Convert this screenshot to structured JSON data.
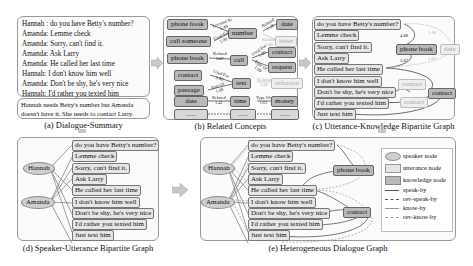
{
  "panel_a": {
    "dialogue": [
      {
        "speaker": "Hannah :",
        "text": "do you have Betty's number?"
      },
      {
        "speaker": "Amanda:",
        "text": "Lemme check"
      },
      {
        "speaker": "Amanda:",
        "text": "Sorry, can't find it."
      },
      {
        "speaker": "Amanda:",
        "text": "Ask Larry"
      },
      {
        "speaker": "Amanda:",
        "text": "He called her last time"
      },
      {
        "speaker": "Hannah:",
        "text": "I don't know him well"
      },
      {
        "speaker": "Amanda:",
        "text": "Don't be shy, he's very nice"
      },
      {
        "speaker": "Hannah:",
        "text": "I'd rather you texted him"
      },
      {
        "speaker": "Amanda:",
        "text": "Just text him"
      }
    ],
    "summary": "Hannah needs Betty's number but Amanda doesn't have it. She needs to contact Larry.",
    "caption": "(a) Dialogue-Summary"
  },
  "panel_b": {
    "caption": "(b) Related Concepts",
    "nodes": {
      "phone_book_1": "phone book",
      "call_someone": "call someone",
      "number": "number",
      "date_1": "date",
      "letter": "letter",
      "phone_book_2": "phone book",
      "call": "call",
      "contact_1": "contact",
      "request": "request",
      "contact_2": "contact",
      "passage": "passage",
      "text": "text",
      "refractor": "refractor",
      "date_2": "date",
      "time": "time",
      "money": "money",
      "dots": "......"
    },
    "relations": {
      "r1": "Located At\n5.49",
      "r2": "Used For\n1.00",
      "r3": "Related\n1.18",
      "r4": "Related\n1.00",
      "r5": "Related\n5.07",
      "r6": "Used For\n1.00",
      "r7": "Type Of\n1.00",
      "r8": "Used For\n1.00",
      "r9": "Part Of\n1.00",
      "r10": "Related\n1.00",
      "r11": "Related\n1.41",
      "r12": "Type Of\n1.61"
    }
  },
  "panel_c": {
    "caption": "(c) Utterance-Knowledge Bipartite Graph",
    "utterances": [
      "do you have Betty's number?",
      "Lemme check",
      "Sorry, can't find it.",
      "Ask Larry",
      "He called her last time",
      "I don't know him well",
      "Don't be shy, he's very nice",
      "I'd rather you texted him",
      "Just text him"
    ],
    "knowledge": {
      "phone_book": "phone book",
      "date": "date",
      "contact": "contact",
      "contact_faint_1": "contact",
      "contact_faint_2": "contact"
    },
    "weights": {
      "w1": "4.88",
      "w2": "1.18",
      "w3": "5.07",
      "w4": "5.07"
    }
  },
  "panel_d": {
    "caption": "(d) Speaker-Utterance Bipartite Graph",
    "speakers": [
      "Hannah",
      "Amanda"
    ],
    "utterances": [
      "do you have Betty's number?",
      "Lemme check",
      "Sorry, can't find it.",
      "Ask Larry",
      "He called her last time",
      "I don't know him well",
      "Don't be shy, he's very nice",
      "I'd rather you texted him",
      "Just text him"
    ]
  },
  "panel_e": {
    "caption": "(e) Heterogeneous Dialogue Graph",
    "speakers": [
      "Hannah",
      "Amanda"
    ],
    "utterances": [
      "do you have Betty's number?",
      "Lemme check",
      "Sorry, can't find it.",
      "Ask Larry",
      "He called her last time",
      "I don't know him well",
      "Don't be shy, he's very nice",
      "I'd rather you texted him",
      "Just text him"
    ],
    "knowledge": [
      "phone book",
      "contact"
    ],
    "legend": [
      {
        "label": "speaker node",
        "kind": "ellipse"
      },
      {
        "label": "utterance node",
        "kind": "light-box"
      },
      {
        "label": "knowledge node",
        "kind": "dark-box"
      },
      {
        "label": "speak-by",
        "kind": "solid-dark"
      },
      {
        "label": "rev-speak-by",
        "kind": "dashed-dark"
      },
      {
        "label": "know-by",
        "kind": "solid-light"
      },
      {
        "label": "rev-know-by",
        "kind": "dashed-light"
      }
    ]
  },
  "colors": {
    "panel_border": "#9a9a9a",
    "knowledge_fill": "#b9b9b9",
    "utterance_fill": "#e6e6e6",
    "speaker_fill": "#cfcfcf",
    "arrow_fill": "#c8c8c8"
  }
}
